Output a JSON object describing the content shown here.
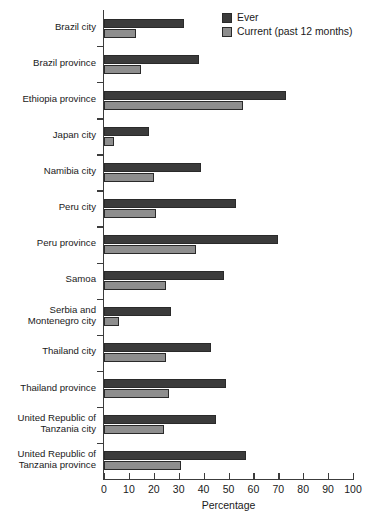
{
  "chart_data": {
    "type": "bar",
    "orientation": "horizontal",
    "title": "",
    "xlabel": "Percentage",
    "ylabel": "",
    "xlim": [
      0,
      100
    ],
    "xticks": [
      0,
      10,
      20,
      30,
      40,
      50,
      60,
      70,
      80,
      90,
      100
    ],
    "grid": false,
    "legend_position": "top-right",
    "categories": [
      "Brazil city",
      "Brazil province",
      "Ethiopia province",
      "Japan city",
      "Namibia city",
      "Peru city",
      "Peru province",
      "Samoa",
      "Serbia and\nMontenegro city",
      "Thailand city",
      "Thailand province",
      "United Republic of\nTanzania city",
      "United Republic of\nTanzania province"
    ],
    "series": [
      {
        "name": "Ever",
        "color": "#3b3b3b",
        "values": [
          32,
          38,
          73,
          18,
          39,
          53,
          70,
          48,
          27,
          43,
          49,
          45,
          57
        ]
      },
      {
        "name": "Current (past 12 months)",
        "color": "#8e8e8e",
        "values": [
          13,
          15,
          56,
          4,
          20,
          21,
          37,
          25,
          6,
          25,
          26,
          24,
          31
        ]
      }
    ]
  },
  "legend": {
    "items": [
      {
        "label": "Ever",
        "swatch": "ever"
      },
      {
        "label": "Current (past 12 months)",
        "swatch": "current"
      }
    ]
  }
}
